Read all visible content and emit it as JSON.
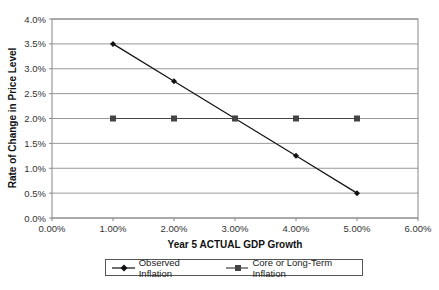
{
  "chart_data": {
    "type": "line",
    "title": "",
    "xlabel": "Year 5 ACTUAL GDP Growth",
    "ylabel": "Rate of Change in Price Level",
    "x_ticks": [
      "0.00%",
      "1.00%",
      "2.00%",
      "3.00%",
      "4.00%",
      "5.00%",
      "6.00%"
    ],
    "y_ticks": [
      "0.0%",
      "0.5%",
      "1.0%",
      "1.5%",
      "2.0%",
      "2.5%",
      "3.0%",
      "3.5%",
      "4.0%"
    ],
    "xlim": [
      0,
      6
    ],
    "ylim": [
      0,
      4
    ],
    "grid": "horizontal",
    "legend_position": "bottom",
    "x": [
      1,
      2,
      3,
      4,
      5
    ],
    "series": [
      {
        "name": "Observed Inflation",
        "marker": "diamond",
        "color": "#111111",
        "values": [
          3.5,
          2.75,
          2.0,
          1.25,
          0.5
        ]
      },
      {
        "name": "Core or Long-Term Inflation",
        "marker": "square",
        "color": "#444444",
        "values": [
          2.0,
          2.0,
          2.0,
          2.0,
          2.0
        ]
      }
    ]
  },
  "legend": {
    "observed": "Observed Inflation",
    "core": "Core or Long-Term Inflation"
  },
  "axes": {
    "xlabel": "Year 5 ACTUAL GDP Growth",
    "ylabel": "Rate of Change in Price Level"
  }
}
